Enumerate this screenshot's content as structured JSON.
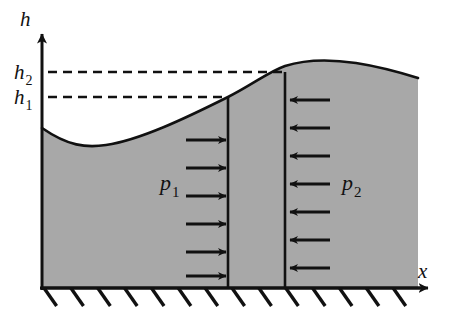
{
  "figure": {
    "background_color": "#ffffff",
    "fluid_fill_color": "#a8a8a8",
    "line_color": "#111111"
  },
  "axes": {
    "vertical": {
      "label": "h",
      "icon": "axis-arrow-up-icon",
      "origin_x": 42,
      "top_y": 28,
      "bottom_y": 288
    },
    "horizontal": {
      "label": "x",
      "icon": "axis-arrow-right-icon",
      "baseline_y": 288,
      "start_x": 42,
      "tip_x": 437
    }
  },
  "levels": [
    {
      "name": "h2",
      "label": "h",
      "subscript": "2",
      "y": 72,
      "dash_start_x": 48,
      "dash_end_x": 285,
      "label_x": 14,
      "label_y": 79
    },
    {
      "name": "h1",
      "label": "h",
      "subscript": "1",
      "y": 97,
      "dash_start_x": 48,
      "dash_end_x": 228,
      "label_x": 14,
      "label_y": 104
    }
  ],
  "walls": [
    {
      "name": "left-wall",
      "x": 228,
      "top_y": 97,
      "bottom_y": 288
    },
    {
      "name": "right-wall",
      "x": 285,
      "top_y": 72,
      "bottom_y": 288
    }
  ],
  "surface": {
    "description": "free surface curve: dips to a trough on the left then rises over a crest on the right",
    "path": "M 42 128 C 68 146 86 148 106 145 C 140 140 186 118 228 97 C 252 85 268 72 285 66 C 310 58 336 60 356 63 C 382 67 402 73 418 78"
  },
  "fluid_body": {
    "left_x": 42,
    "right_x": 418,
    "ground_y": 288
  },
  "ground": {
    "name": "fixed-support-hatching",
    "y": 288,
    "start_x": 42,
    "end_x": 418,
    "hatch_count": 14,
    "hatch_length": 22,
    "hatch_angle_deg": 55
  },
  "pressure_left": {
    "name": "p1",
    "label": "p",
    "subscript": "1",
    "label_x": 160,
    "label_y": 190,
    "direction": "right",
    "arrow_tip_x": 226,
    "arrow_tail_x": 186,
    "arrow_ys": [
      140,
      168,
      196,
      224,
      252,
      276
    ]
  },
  "pressure_right": {
    "name": "p2",
    "label": "p",
    "subscript": "2",
    "label_x": 342,
    "label_y": 190,
    "direction": "left",
    "arrow_tip_x": 290,
    "arrow_tail_x": 330,
    "arrow_ys": [
      100,
      128,
      156,
      184,
      212,
      240,
      268
    ]
  }
}
